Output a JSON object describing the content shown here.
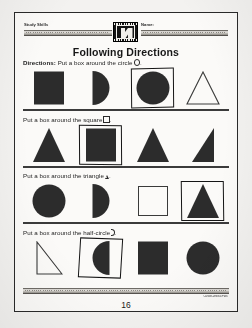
{
  "page": {
    "title": "Following Directions",
    "page_number": "16",
    "copyright": "Carson-Dellosa Publ."
  },
  "header": {
    "subject_label": "Study Skills",
    "name_label": "Name:",
    "logo_icon": "publisher-stamp-icon"
  },
  "exercises": [
    {
      "lead": "Directions:",
      "text": "Put a box around the circle",
      "target_glyph": "circle",
      "shapes": [
        {
          "name": "filled-square",
          "kind": "sq-fill",
          "boxed": false
        },
        {
          "name": "half-circle-right",
          "kind": "hc-fill-r",
          "boxed": false
        },
        {
          "name": "filled-circle",
          "kind": "ci-fill",
          "boxed": true
        },
        {
          "name": "outlined-triangle",
          "kind": "tri-out",
          "boxed": false
        }
      ]
    },
    {
      "lead": "",
      "text": "Put a box around the square",
      "target_glyph": "square",
      "shapes": [
        {
          "name": "filled-triangle",
          "kind": "tri-fill",
          "boxed": false
        },
        {
          "name": "filled-square",
          "kind": "sq-fill",
          "boxed": true
        },
        {
          "name": "filled-triangle",
          "kind": "tri-fill",
          "boxed": false
        },
        {
          "name": "filled-right-triangle",
          "kind": "rtri-fill",
          "boxed": false
        }
      ]
    },
    {
      "lead": "",
      "text": "Put a box around the triangle",
      "target_glyph": "triangle",
      "shapes": [
        {
          "name": "filled-circle",
          "kind": "ci-fill",
          "boxed": false
        },
        {
          "name": "half-circle-right",
          "kind": "hc-fill-r",
          "boxed": false
        },
        {
          "name": "outlined-square",
          "kind": "sq-out",
          "boxed": false
        },
        {
          "name": "filled-triangle",
          "kind": "tri-fill",
          "boxed": true
        }
      ]
    },
    {
      "lead": "",
      "text": "Put a box around the half-circle",
      "target_glyph": "half-circle",
      "shapes": [
        {
          "name": "outlined-right-triangle",
          "kind": "rtri-out",
          "boxed": false
        },
        {
          "name": "half-circle-left",
          "kind": "hc-fill-l",
          "boxed": true
        },
        {
          "name": "filled-square",
          "kind": "sq-fill",
          "boxed": false
        },
        {
          "name": "filled-circle",
          "kind": "ci-fill",
          "boxed": false
        }
      ]
    }
  ]
}
